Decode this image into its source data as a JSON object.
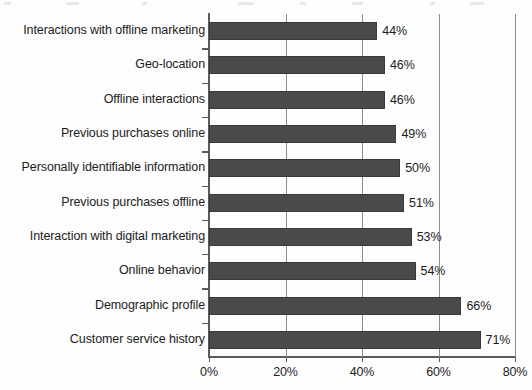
{
  "chart_data": {
    "type": "bar",
    "orientation": "horizontal",
    "title": "",
    "subtitle": "",
    "xlabel": "",
    "ylabel": "",
    "xlim": [
      0,
      80
    ],
    "xticks": [
      0,
      20,
      40,
      60,
      80
    ],
    "xtick_labels": [
      "0%",
      "20%",
      "40%",
      "60%",
      "80%"
    ],
    "grid": true,
    "grid_axis": "x",
    "legend": false,
    "value_suffix": "%",
    "bar_color": "#4a4a4a",
    "bar_edge_color": "#3a3a3a",
    "axis_color": "#5b5b5b",
    "gridline_color": "#8e8e8e",
    "text_color": "#1c1c1c",
    "background_color": "#fdfdfd",
    "categories": [
      "Interactions with offline marketing",
      "Geo-location",
      "Offline interactions",
      "Previous purchases online",
      "Personally identifiable information",
      "Previous purchases offline",
      "Interaction with digital marketing",
      "Online behavior",
      "Demographic profile",
      "Customer service history"
    ],
    "values": [
      44,
      46,
      46,
      49,
      50,
      51,
      53,
      54,
      66,
      71
    ],
    "value_labels": [
      "44%",
      "46%",
      "46%",
      "49%",
      "50%",
      "51%",
      "53%",
      "54%",
      "66%",
      "71%"
    ]
  }
}
